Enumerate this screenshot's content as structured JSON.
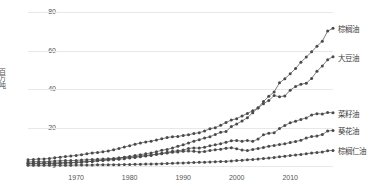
{
  "chart_data": {
    "type": "line",
    "title": "",
    "xlabel": "",
    "ylabel": "百万吨",
    "xlim": [
      1961,
      2018
    ],
    "ylim": [
      0,
      80
    ],
    "grid": true,
    "legend_position": "right-inline",
    "markers": true,
    "xticks": [
      1970,
      1980,
      1990,
      2000,
      2010
    ],
    "yticks": [
      0,
      20,
      40,
      60,
      80
    ],
    "x": [
      1961,
      1962,
      1963,
      1964,
      1965,
      1966,
      1967,
      1968,
      1969,
      1970,
      1971,
      1972,
      1973,
      1974,
      1975,
      1976,
      1977,
      1978,
      1979,
      1980,
      1981,
      1982,
      1983,
      1984,
      1985,
      1986,
      1987,
      1988,
      1989,
      1990,
      1991,
      1992,
      1993,
      1994,
      1995,
      1996,
      1997,
      1998,
      1999,
      2000,
      2001,
      2002,
      2003,
      2004,
      2005,
      2006,
      2007,
      2008,
      2009,
      2010,
      2011,
      2012,
      2013,
      2014,
      2015,
      2016,
      2017,
      2018
    ],
    "series": [
      {
        "name": "棕榈油",
        "label": "棕榈油",
        "color": "#4a4a4a",
        "values": [
          1.4,
          1.4,
          1.4,
          1.5,
          1.3,
          1.3,
          1.4,
          1.5,
          1.6,
          1.8,
          2.0,
          2.2,
          2.4,
          2.8,
          3.1,
          3.4,
          3.7,
          4.1,
          4.6,
          4.9,
          5.4,
          5.9,
          6.3,
          6.8,
          7.4,
          8.2,
          8.6,
          9.4,
          10.2,
          11.0,
          11.9,
          12.9,
          13.7,
          14.5,
          15.2,
          16.4,
          17.5,
          17.9,
          20.5,
          21.8,
          23.4,
          25.1,
          27.7,
          30.2,
          33.5,
          36.2,
          38.5,
          43.2,
          45.3,
          47.9,
          50.6,
          53.9,
          56.6,
          59.3,
          62.2,
          64.8,
          70.1,
          71.5
        ]
      },
      {
        "name": "大豆油",
        "label": "大豆油",
        "color": "#4a4a4a",
        "values": [
          3.2,
          3.4,
          3.6,
          3.7,
          3.9,
          4.3,
          4.6,
          4.9,
          5.2,
          5.5,
          5.9,
          6.3,
          6.8,
          7.0,
          7.4,
          7.8,
          8.4,
          9.1,
          9.9,
          10.5,
          11.3,
          11.9,
          12.5,
          12.9,
          13.5,
          14.1,
          14.8,
          15.2,
          15.3,
          15.9,
          16.2,
          16.9,
          17.3,
          18.2,
          19.4,
          19.9,
          21.2,
          22.6,
          23.9,
          24.6,
          26.0,
          27.3,
          28.7,
          30.1,
          32.4,
          34.0,
          36.6,
          36.0,
          36.4,
          39.4,
          41.3,
          42.5,
          43.0,
          45.5,
          49.2,
          52.0,
          55.2,
          56.8
        ]
      },
      {
        "name": "菜籽油",
        "label": "菜籽油",
        "color": "#4a4a4a",
        "values": [
          1.2,
          1.3,
          1.3,
          1.4,
          1.5,
          1.6,
          1.7,
          1.8,
          1.8,
          1.9,
          2.1,
          2.3,
          2.5,
          2.7,
          2.9,
          3.1,
          3.3,
          3.5,
          3.8,
          4.2,
          4.4,
          4.8,
          5.2,
          5.5,
          6.1,
          6.6,
          7.1,
          7.6,
          7.9,
          8.3,
          9.1,
          9.4,
          9.3,
          9.8,
          10.5,
          11.0,
          11.6,
          12.3,
          13.1,
          13.2,
          12.9,
          13.3,
          12.8,
          14.0,
          16.2,
          17.0,
          17.3,
          19.5,
          21.0,
          22.5,
          23.2,
          24.2,
          25.0,
          26.5,
          27.2,
          27.0,
          27.8,
          27.6
        ]
      },
      {
        "name": "葵花油",
        "label": "葵花油",
        "color": "#4a4a4a",
        "values": [
          2.1,
          2.2,
          2.3,
          2.2,
          2.4,
          2.6,
          2.7,
          2.8,
          2.8,
          2.9,
          3.1,
          3.2,
          3.4,
          3.5,
          3.6,
          3.8,
          3.9,
          4.2,
          4.4,
          4.6,
          4.8,
          5.2,
          5.5,
          5.8,
          6.1,
          6.4,
          6.7,
          7.1,
          7.3,
          7.6,
          7.8,
          7.6,
          7.3,
          7.5,
          8.1,
          8.4,
          8.7,
          9.2,
          9.5,
          9.0,
          8.3,
          8.0,
          8.6,
          9.1,
          9.6,
          10.3,
          10.6,
          11.2,
          11.5,
          12.2,
          12.7,
          13.4,
          14.5,
          15.3,
          15.6,
          16.4,
          18.2,
          18.5
        ]
      },
      {
        "name": "棕榈仁油",
        "label": "棕榈仁油",
        "color": "#4a4a4a",
        "values": [
          0.4,
          0.4,
          0.4,
          0.4,
          0.4,
          0.4,
          0.4,
          0.4,
          0.4,
          0.5,
          0.5,
          0.5,
          0.5,
          0.6,
          0.6,
          0.6,
          0.7,
          0.7,
          0.8,
          0.8,
          0.9,
          0.9,
          1.0,
          1.0,
          1.1,
          1.2,
          1.3,
          1.4,
          1.5,
          1.6,
          1.7,
          1.8,
          1.9,
          2.0,
          2.1,
          2.2,
          2.3,
          2.4,
          2.6,
          2.8,
          3.0,
          3.2,
          3.4,
          3.6,
          3.9,
          4.1,
          4.4,
          4.8,
          5.1,
          5.4,
          5.7,
          6.0,
          6.4,
          6.7,
          7.0,
          7.3,
          7.9,
          8.1
        ]
      }
    ]
  },
  "axis": {
    "ylabel_text": "百万吨"
  }
}
